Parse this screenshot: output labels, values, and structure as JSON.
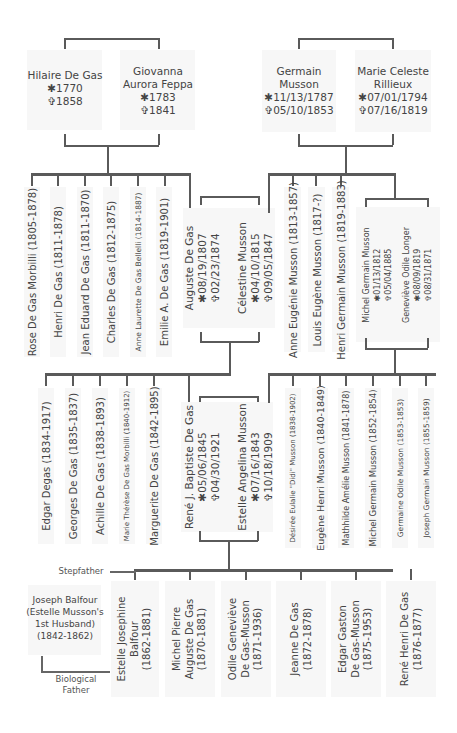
{
  "symbols": {
    "born": "✱",
    "died": "✞"
  },
  "generation1": {
    "left_couple": [
      {
        "name": "Hilaire De Gas",
        "born": "✱1770",
        "died": "✞1858"
      },
      {
        "name": "Giovanna Aurora Feppa",
        "name_l1": "Giovanna",
        "name_l2": "Aurora Feppa",
        "born": "✱1783",
        "died": "✞1841"
      }
    ],
    "right_couple": [
      {
        "name": "Germain Musson",
        "name_l1": "Germain",
        "name_l2": "Musson",
        "born": "✱11/13/1787",
        "died": "✞05/10/1853"
      },
      {
        "name": "Marie Celeste Rillieux",
        "name_l1": "Marie Celeste",
        "name_l2": "Rillieux",
        "born": "✱07/01/1794",
        "died": "✞07/16/1819"
      }
    ]
  },
  "generation2": {
    "de_gas_children": [
      "Rose De Gas Morbilli (1805-1878)",
      "Henri De Gas (1811-1878)",
      "Jean Eduard De Gas (1811-1870)",
      "Charles De Gas (1812-1875)",
      "Anne Laurette De Gas Bellelli (1814-1887)",
      "Emilie A. De Gas (1819-1901)"
    ],
    "couple": [
      {
        "name": "Auguste De Gas",
        "born": "✱08/19/1807",
        "died": "✞02/23/1874"
      },
      {
        "name": "Célestine Musson",
        "born": "✱04/10/1815",
        "died": "✞09/05/1847"
      }
    ],
    "musson_children": [
      "Anne Eugénie Musson (1813-1857)",
      "Louis Eugène Musson (1817-?)",
      "Henri Germain Musson (1819-1883)"
    ],
    "musson_couple": [
      {
        "name": "Michel Germain Musson",
        "born": "✱01/13/1812",
        "died": "✞05/04/1885"
      },
      {
        "name": "Geneviève Odile Longer",
        "born": "✱08/09/1819",
        "died": "✞08/31/1871"
      }
    ]
  },
  "generation3": {
    "de_gas_children": [
      "Edgar Degas (1834-1917)",
      "Georges De Gas (1835-1837)",
      "Achille De Gas (1838-1893)",
      "Marie Thérèse De Gas Morbilli (1840-1912)",
      "Marguerite De Gas (1842-1895)"
    ],
    "couple": [
      {
        "name": "René J. Baptiste De Gas",
        "born": "✱05/06/1845",
        "died": "✞04/30/1921"
      },
      {
        "name": "Estelle Angelina Musson",
        "born": "✱07/16/1843",
        "died": "✞10/18/1909"
      }
    ],
    "musson_children": [
      "Désirée Eulalie \"Didi\" Musson (1838-1902)",
      "Eugène Henri Musson (1840-1849)",
      "Mathhilde Amélie Musson (1841-1878)",
      "Michel Germain Musson (1852-1854)",
      "Germaine Odile Musson (1853-1853)",
      "Joseph Germain Musson (1855-1859)"
    ]
  },
  "generation4": {
    "biological_father": {
      "l1": "Joseph Balfour",
      "l2": "(Estelle Musson's",
      "l3": "1st Husband)",
      "l4": "(1842-1862)"
    },
    "labels": {
      "stepfather": "Stepfather",
      "bio_l1": "Biological",
      "bio_l2": "Father"
    },
    "children": [
      {
        "l1": "Estelle Josephine",
        "l2": "Balfour",
        "l3": "(1862-1881)"
      },
      {
        "l1": "Michel Pierre",
        "l2": "Auguste De Gas",
        "l3": "(1870-1881)"
      },
      {
        "l1": "Odile Geneviève",
        "l2": "De Gas-Musson",
        "l3": "(1871-1936)"
      },
      {
        "l1": "Jeanne De Gas",
        "l2": "(1872-1878)",
        "l3": ""
      },
      {
        "l1": "Edgar Gaston",
        "l2": "De Gas-Musson",
        "l3": "(1875-1953)"
      },
      {
        "l1": "René Henri De Gas",
        "l2": "(1876-1877)",
        "l3": ""
      }
    ]
  }
}
